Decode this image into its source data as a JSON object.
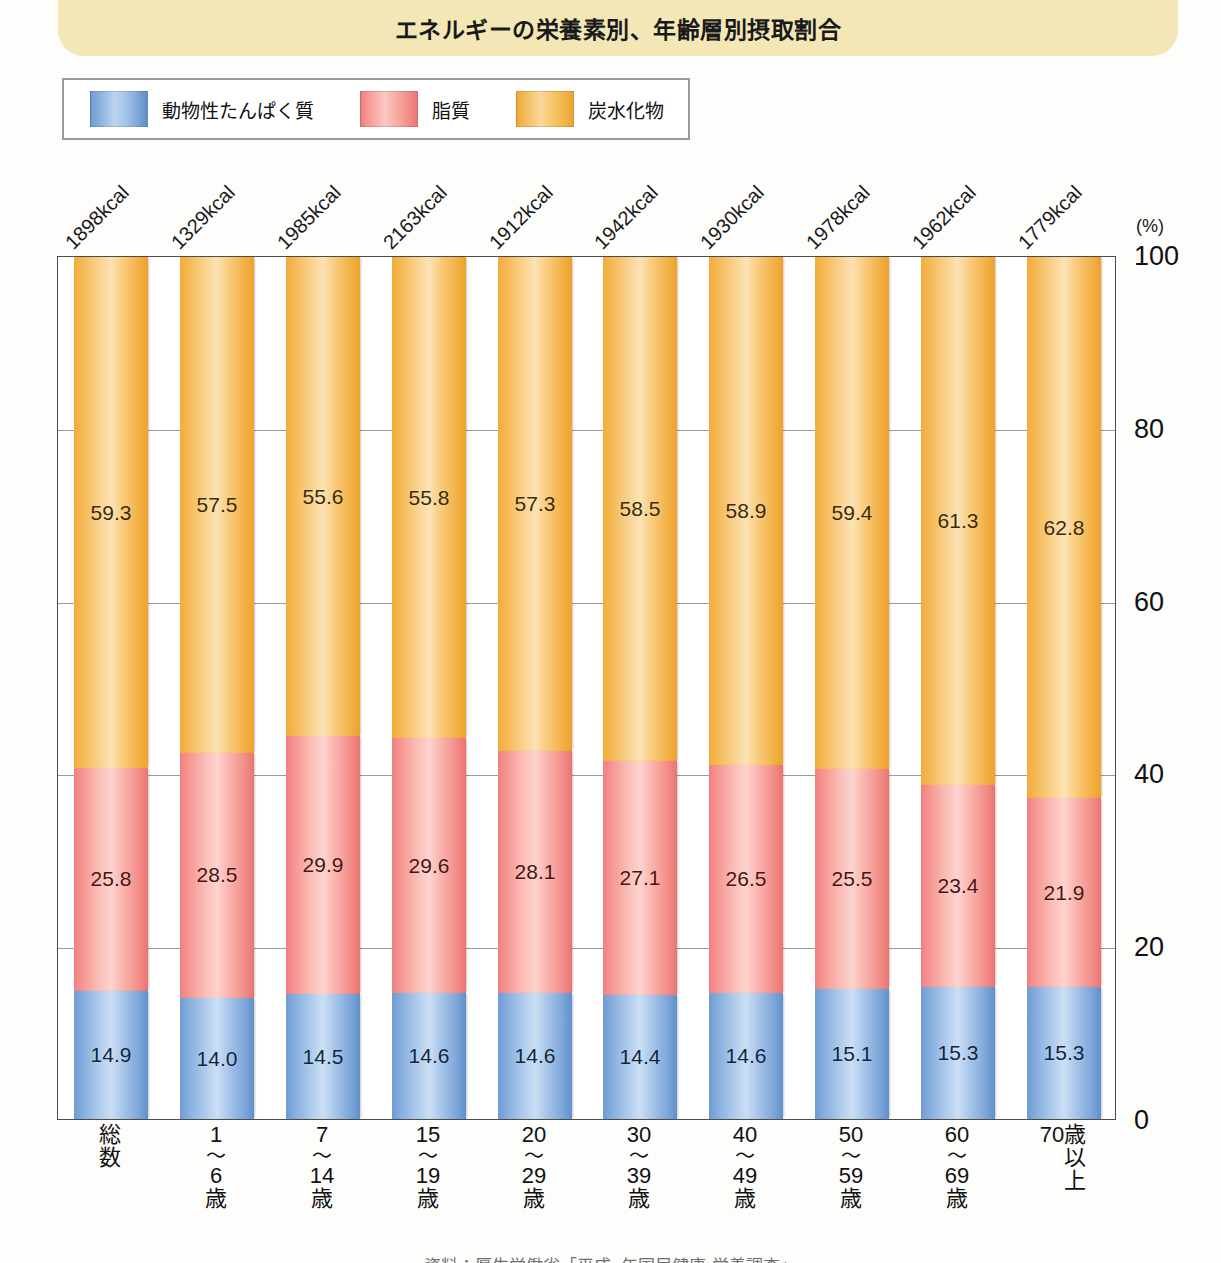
{
  "title": "エネルギーの栄養素別、年齢層別摂取割合",
  "legend": {
    "items": [
      {
        "label": "動物性たんぱく質",
        "color": "#7aa4d7",
        "key": "protein"
      },
      {
        "label": "脂質",
        "color": "#f28b86",
        "key": "fat"
      },
      {
        "label": "炭水化物",
        "color": "#f2b247",
        "key": "carb"
      }
    ]
  },
  "yaxis": {
    "unit": "(%)",
    "ticks": [
      "100",
      "80",
      "60",
      "40",
      "20",
      "0"
    ]
  },
  "source_note": "資料：厚生労働省「平成○年国民健康・栄養調査」",
  "chart_data": {
    "type": "bar",
    "subtype": "stacked-100-percent",
    "title": "エネルギーの栄養素別、年齢層別摂取割合",
    "xlabel": "",
    "ylabel": "",
    "yunit": "(%)",
    "ylim": [
      0,
      100
    ],
    "yticks": [
      0,
      20,
      40,
      60,
      80,
      100
    ],
    "grid": true,
    "legend_position": "top-left",
    "categories": [
      "総数",
      "1〜6歳",
      "7〜14歳",
      "15〜19歳",
      "20〜29歳",
      "30〜39歳",
      "40〜49歳",
      "50〜59歳",
      "60〜69歳",
      "70歳以上"
    ],
    "category_parts": [
      {
        "top": "総",
        "tilde": "",
        "mid": "",
        "bottom": "数",
        "vertical": false
      },
      {
        "top": "1",
        "tilde": "〜",
        "mid": "6",
        "bottom": "歳",
        "vertical": false
      },
      {
        "top": "7",
        "tilde": "〜",
        "mid": "14",
        "bottom": "歳",
        "vertical": false
      },
      {
        "top": "15",
        "tilde": "〜",
        "mid": "19",
        "bottom": "歳",
        "vertical": false
      },
      {
        "top": "20",
        "tilde": "〜",
        "mid": "29",
        "bottom": "歳",
        "vertical": false
      },
      {
        "top": "30",
        "tilde": "〜",
        "mid": "39",
        "bottom": "歳",
        "vertical": false
      },
      {
        "top": "40",
        "tilde": "〜",
        "mid": "49",
        "bottom": "歳",
        "vertical": false
      },
      {
        "top": "50",
        "tilde": "〜",
        "mid": "59",
        "bottom": "歳",
        "vertical": false
      },
      {
        "top": "60",
        "tilde": "〜",
        "mid": "69",
        "bottom": "歳",
        "vertical": false
      },
      {
        "top": "70",
        "tilde": "",
        "mid": "",
        "bottom": "歳以上",
        "vertical": true
      }
    ],
    "annotations_top": [
      "1898kcal",
      "1329kcal",
      "1985kcal",
      "2163kcal",
      "1912kcal",
      "1942kcal",
      "1930kcal",
      "1978kcal",
      "1962kcal",
      "1779kcal"
    ],
    "series": [
      {
        "name": "動物性たんぱく質",
        "key": "protein",
        "color": "#7aa4d7",
        "values": [
          14.9,
          14.0,
          14.5,
          14.6,
          14.6,
          14.4,
          14.6,
          15.1,
          15.3,
          15.3
        ]
      },
      {
        "name": "脂質",
        "key": "fat",
        "color": "#f28b86",
        "values": [
          25.8,
          28.5,
          29.9,
          29.6,
          28.1,
          27.1,
          26.5,
          25.5,
          23.4,
          21.9
        ]
      },
      {
        "name": "炭水化物",
        "key": "carb",
        "color": "#f2b247",
        "values": [
          59.3,
          57.5,
          55.6,
          55.8,
          57.3,
          58.5,
          58.9,
          59.4,
          61.3,
          62.8
        ]
      }
    ],
    "value_labels": {
      "protein": [
        "14.9",
        "14.0",
        "14.5",
        "14.6",
        "14.6",
        "14.4",
        "14.6",
        "15.1",
        "15.3",
        "15.3"
      ],
      "fat": [
        "25.8",
        "28.5",
        "29.9",
        "29.6",
        "28.1",
        "27.1",
        "26.5",
        "25.5",
        "23.4",
        "21.9"
      ],
      "carb": [
        "59.3",
        "57.5",
        "55.6",
        "55.8",
        "57.3",
        "58.5",
        "58.9",
        "59.4",
        "61.3",
        "62.8"
      ]
    }
  }
}
